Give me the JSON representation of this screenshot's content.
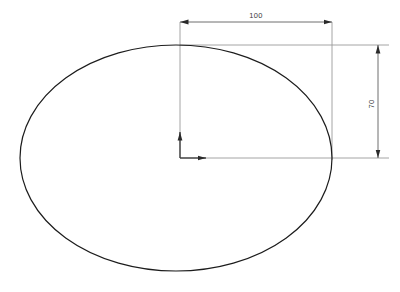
{
  "drawing": {
    "title": "Ellipse with centered origin and dimensions",
    "type": "technical-drawing",
    "canvas": {
      "width": 400,
      "height": 292,
      "background": "#ffffff"
    },
    "colors": {
      "shape_stroke": "#1c1c1c",
      "dimension_line": "#6e6e6e",
      "extension_line": "#9a9a9a",
      "origin_axis": "#3c3c3c",
      "text": "#3a3a3a"
    },
    "shape": {
      "name": "ellipse",
      "center_x": 176,
      "center_y": 158,
      "radius_x": 156,
      "radius_y": 113,
      "stroke_width": 1.2
    },
    "origin": {
      "label": "origin-marker",
      "x": 180,
      "y": 158,
      "x_axis_tip": 206,
      "y_axis_tip": 132
    },
    "dimensions": [
      {
        "id": "width-dimension",
        "label": "100",
        "orientation": "horizontal",
        "value": 100,
        "line_y": 22,
        "from_x": 180,
        "to_x": 332,
        "text_x": 256,
        "text_y": 18
      },
      {
        "id": "height-dimension",
        "label": "70",
        "orientation": "vertical",
        "value": 70,
        "line_x": 378,
        "from_y": 45,
        "to_y": 158,
        "text_x": 374,
        "text_y": 104,
        "text_rotation": -90
      }
    ],
    "extension_lines": [
      {
        "id": "ext-left-vertical",
        "x1": 180,
        "y1": 22,
        "x2": 180,
        "y2": 158
      },
      {
        "id": "ext-right-vertical",
        "x1": 332,
        "y1": 22,
        "x2": 332,
        "y2": 160
      },
      {
        "id": "ext-top-horizontal",
        "x1": 180,
        "y1": 45,
        "x2": 389,
        "y2": 45
      },
      {
        "id": "ext-bottom-horizontal",
        "x1": 180,
        "y1": 158,
        "x2": 389,
        "y2": 158
      }
    ]
  }
}
